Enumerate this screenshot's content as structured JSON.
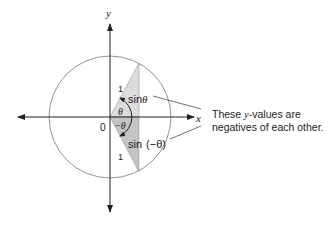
{
  "diagram": {
    "axes": {
      "x_label": "x",
      "y_label": "y",
      "origin_label": "0"
    },
    "triangle_upper": {
      "hypotenuse_label": "1",
      "side_label_prefix": "sin",
      "side_label_var": "θ",
      "angle_label": "θ"
    },
    "triangle_lower": {
      "hypotenuse_label": "1",
      "side_label_prefix": "sin",
      "side_label_var": "(−θ)",
      "angle_label": "−θ"
    },
    "annotation": {
      "line1_pre": "These ",
      "line1_var": "y",
      "line1_post": "-values are",
      "line2": "negatives of each other."
    },
    "colors": {
      "upper_fill": "#dcdcdc",
      "lower_fill": "#c4c4c4",
      "stroke": "#333333",
      "circle": "#777777"
    }
  }
}
